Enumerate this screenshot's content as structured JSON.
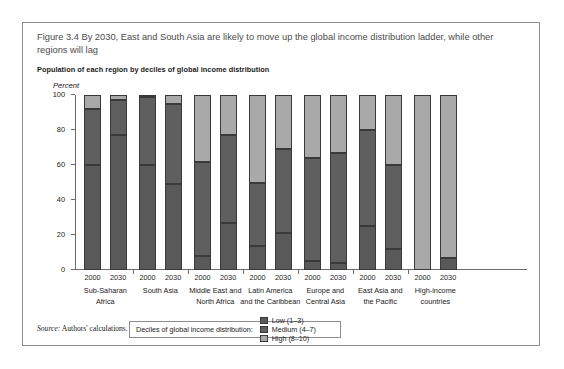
{
  "figure": {
    "title": "Figure 3.4  By 2030, East and South Asia are likely to move up the global income distribution ladder, while other regions will lag",
    "subtitle": "Population of each region by deciles of global income distribution",
    "source_word": "Source:",
    "source_text": " Authors' calculations."
  },
  "legend": {
    "title": "Deciles of global income distribution:",
    "items": [
      {
        "label": "Low (1–3)",
        "key": "low",
        "color": "#595959"
      },
      {
        "label": "Medium (4–7)",
        "key": "medium",
        "color": "#5f5f5f"
      },
      {
        "label": "High (8–10)",
        "key": "high",
        "color": "#a9a9a9"
      }
    ]
  },
  "chart_data": {
    "type": "bar",
    "subtype": "stacked-vertical-grouped",
    "title": "Population of each region by deciles of global income distribution",
    "xlabel": "",
    "ylabel": "Percent",
    "ylim": [
      0,
      100
    ],
    "yticks": [
      0,
      20,
      40,
      60,
      80,
      100
    ],
    "ytick_labels": [
      "0",
      "20",
      "40",
      "60",
      "80",
      "100"
    ],
    "grid": false,
    "legend_position": "below-plot",
    "stack_order": [
      "low",
      "medium",
      "high"
    ],
    "series": [
      {
        "name": "Low (1–3)",
        "values": [
          60,
          77,
          60,
          49,
          8,
          27,
          14,
          21,
          5,
          4,
          25,
          12,
          0,
          7
        ]
      },
      {
        "name": "Medium (4–7)",
        "values": [
          32,
          20,
          39,
          46,
          54,
          50,
          36,
          48,
          59,
          63,
          55,
          48,
          0,
          0
        ]
      },
      {
        "name": "High (8–10)",
        "values": [
          8,
          3,
          1,
          5,
          38,
          23,
          50,
          31,
          36,
          33,
          20,
          40,
          100,
          93
        ]
      }
    ],
    "categories": [
      "Sub-Saharan Africa 2000",
      "Sub-Saharan Africa 2030",
      "South Asia 2000",
      "South Asia 2030",
      "Middle East and North Africa 2000",
      "Middle East and North Africa 2030",
      "Latin America and the Caribbean 2000",
      "Latin America and the Caribbean 2030",
      "Europe and Central Asia 2000",
      "Europe and Central Asia 2030",
      "East Asia and the Pacific 2000",
      "East Asia and the Pacific 2030",
      "High-income countries 2000",
      "High-income countries 2030"
    ],
    "groups": [
      {
        "region_lines": [
          "Sub-Saharan",
          "Africa"
        ],
        "bars": [
          {
            "year": "2000",
            "low": 60,
            "medium": 32,
            "high": 8
          },
          {
            "year": "2030",
            "low": 77,
            "medium": 20,
            "high": 3
          }
        ]
      },
      {
        "region_lines": [
          "South Asia"
        ],
        "bars": [
          {
            "year": "2000",
            "low": 60,
            "medium": 39,
            "high": 1
          },
          {
            "year": "2030",
            "low": 49,
            "medium": 46,
            "high": 5
          }
        ]
      },
      {
        "region_lines": [
          "Middle East and",
          "North Africa"
        ],
        "bars": [
          {
            "year": "2000",
            "low": 8,
            "medium": 54,
            "high": 38
          },
          {
            "year": "2030",
            "low": 27,
            "medium": 50,
            "high": 23
          }
        ]
      },
      {
        "region_lines": [
          "Latin America",
          "and the Caribbean"
        ],
        "bars": [
          {
            "year": "2000",
            "low": 14,
            "medium": 36,
            "high": 50
          },
          {
            "year": "2030",
            "low": 21,
            "medium": 48,
            "high": 31
          }
        ]
      },
      {
        "region_lines": [
          "Europe and",
          "Central Asia"
        ],
        "bars": [
          {
            "year": "2000",
            "low": 5,
            "medium": 59,
            "high": 36
          },
          {
            "year": "2030",
            "low": 4,
            "medium": 63,
            "high": 33
          }
        ]
      },
      {
        "region_lines": [
          "East Asia and",
          "the Pacific"
        ],
        "bars": [
          {
            "year": "2000",
            "low": 25,
            "medium": 55,
            "high": 20
          },
          {
            "year": "2030",
            "low": 12,
            "medium": 48,
            "high": 40
          }
        ]
      },
      {
        "region_lines": [
          "High-income",
          "countries"
        ],
        "bars": [
          {
            "year": "2000",
            "low": 0,
            "medium": 0,
            "high": 100
          },
          {
            "year": "2030",
            "low": 7,
            "medium": 0,
            "high": 93
          }
        ]
      }
    ]
  }
}
